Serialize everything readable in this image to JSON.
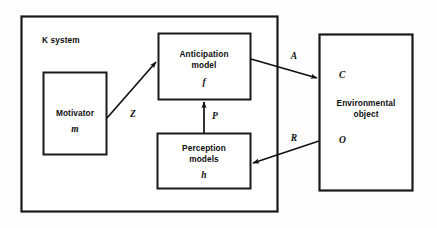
{
  "figure": {
    "type": "block-diagram",
    "background_color": "#fdfdfd",
    "line_color": "#111111"
  },
  "containers": {
    "k_system": {
      "label": "K system"
    },
    "environment": {
      "label_line1": "Environmental",
      "label_line2": "object",
      "symbol_top": "C",
      "symbol_bottom": "O"
    }
  },
  "nodes": {
    "motivator": {
      "label_line1": "Motivator",
      "symbol": "m"
    },
    "anticipation": {
      "label_line1": "Anticipation",
      "label_line2": "model",
      "symbol": "f"
    },
    "perception": {
      "label_line1": "Perception",
      "label_line2": "models",
      "symbol": "h"
    }
  },
  "edges": {
    "motivator_to_anticipation": {
      "label": "Z"
    },
    "perception_to_anticipation": {
      "label": "P"
    },
    "anticipation_to_environment": {
      "label": "A"
    },
    "environment_to_perception": {
      "label": "R"
    }
  }
}
